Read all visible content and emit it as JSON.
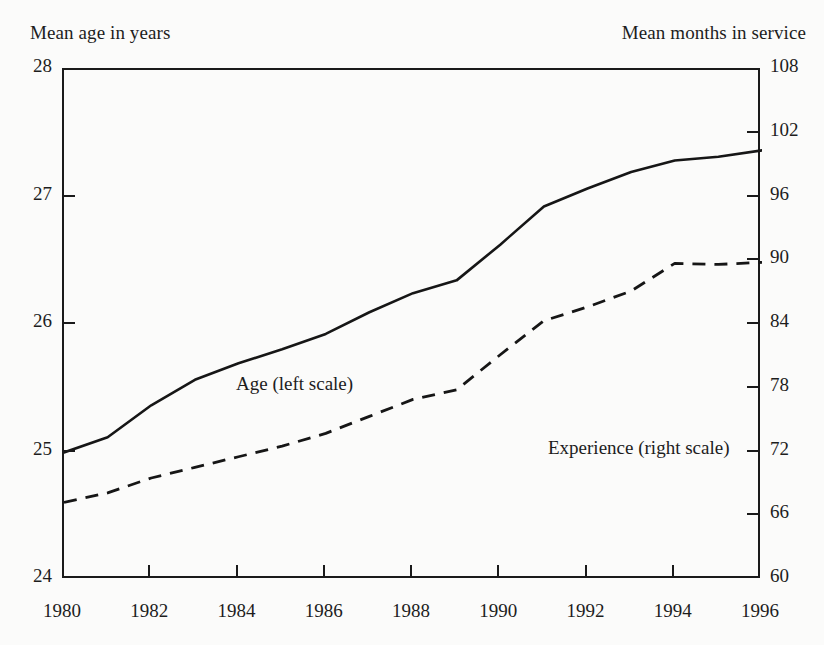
{
  "chart_data": {
    "type": "line",
    "title": "",
    "subtitle": "",
    "xlabel": "",
    "ylabel": "Mean age in years",
    "y2label": "Mean months in service",
    "grid": false,
    "legend_position": "inline-annotations",
    "x": [
      1980,
      1981,
      1982,
      1983,
      1984,
      1985,
      1986,
      1987,
      1988,
      1989,
      1990,
      1991,
      1992,
      1993,
      1994,
      1995,
      1996
    ],
    "xlim": [
      1980,
      1996
    ],
    "ylim": [
      24,
      28
    ],
    "y2lim": [
      60,
      108
    ],
    "xticks": [
      "1980",
      "1982",
      "1984",
      "1986",
      "1988",
      "1990",
      "1992",
      "1994",
      "1996"
    ],
    "xtick_values": [
      1980,
      1982,
      1984,
      1986,
      1988,
      1990,
      1992,
      1994,
      1996
    ],
    "yticks": [
      "24",
      "25",
      "26",
      "27",
      "28"
    ],
    "ytick_values": [
      24,
      25,
      26,
      27,
      28
    ],
    "y2ticks": [
      "60",
      "66",
      "72",
      "78",
      "84",
      "90",
      "96",
      "102",
      "108"
    ],
    "y2tick_values": [
      60,
      66,
      72,
      78,
      84,
      90,
      96,
      102,
      108
    ],
    "series": [
      {
        "name": "Age (left scale)",
        "axis": "left",
        "style": "solid",
        "color": "#161616",
        "values": [
          25.0,
          25.12,
          25.37,
          25.57,
          25.7,
          25.81,
          25.93,
          26.1,
          26.25,
          26.35,
          26.63,
          26.93,
          27.07,
          27.2,
          27.29,
          27.32,
          27.37
        ]
      },
      {
        "name": "Experience (right scale)",
        "axis": "right",
        "style": "dashed",
        "color": "#161616",
        "values": [
          67.3,
          68.2,
          69.6,
          70.6,
          71.6,
          72.6,
          73.8,
          75.4,
          77.0,
          77.9,
          81.2,
          84.4,
          85.7,
          87.2,
          89.8,
          89.7,
          89.9
        ]
      }
    ],
    "annotations": [
      {
        "text": "Age (left scale)",
        "x": 1982.5,
        "y": 26.08
      },
      {
        "text": "Experience (right scale)",
        "x": 1990.3,
        "y": 25.57
      }
    ]
  },
  "axes": {
    "left_caption": "Mean age in years",
    "right_caption": "Mean months in service"
  }
}
